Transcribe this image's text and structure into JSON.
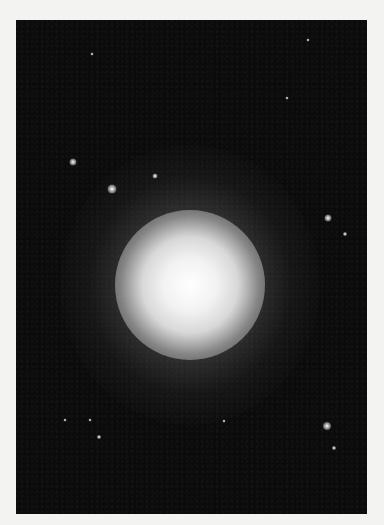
{
  "image": {
    "description": "Elliptical galaxy photographed against a dark star field",
    "background_color": "#f3f3f1",
    "panel_color": "#0b0b0b",
    "galaxy": {
      "cx": 174,
      "cy": 265,
      "core_color": "#ffffff"
    },
    "stars": [
      {
        "x": 57,
        "y": 142,
        "size": 7
      },
      {
        "x": 96,
        "y": 169,
        "size": 9
      },
      {
        "x": 139,
        "y": 156,
        "size": 5
      },
      {
        "x": 312,
        "y": 198,
        "size": 7
      },
      {
        "x": 329,
        "y": 214,
        "size": 4
      },
      {
        "x": 311,
        "y": 406,
        "size": 8
      },
      {
        "x": 318,
        "y": 428,
        "size": 4
      },
      {
        "x": 83,
        "y": 417,
        "size": 4
      },
      {
        "x": 74,
        "y": 400,
        "size": 3
      },
      {
        "x": 49,
        "y": 400,
        "size": 3
      },
      {
        "x": 292,
        "y": 20,
        "size": 3
      },
      {
        "x": 76,
        "y": 34,
        "size": 3
      },
      {
        "x": 271,
        "y": 78,
        "size": 3
      },
      {
        "x": 208,
        "y": 401,
        "size": 3
      }
    ]
  }
}
